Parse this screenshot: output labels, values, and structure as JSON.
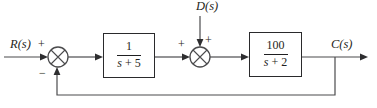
{
  "colors": {
    "line": "#4b4b4d",
    "arrow": "#2e2e30",
    "ink": "#1f1f21",
    "border": "#2a2a2c",
    "background": "#ffffff"
  },
  "diagram": {
    "input_label": "R(s)",
    "disturbance_label": "D(s)",
    "output_label": "C(s)",
    "sum1": {
      "top_sign": "+",
      "bottom_sign": "−"
    },
    "sum2": {
      "left_sign": "+",
      "top_sign": "+"
    },
    "blocks": [
      {
        "numerator": "1",
        "den_var": "s",
        "den_rest": "+ 5"
      },
      {
        "numerator": "100",
        "den_var": "s",
        "den_rest": "+ 2"
      }
    ]
  }
}
